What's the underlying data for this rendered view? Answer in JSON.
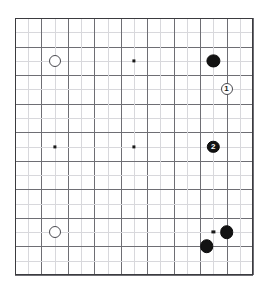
{
  "diagram": {
    "kind": "go-board-diagram",
    "board_size": 19,
    "canvas": {
      "width": 269,
      "height": 297
    },
    "board_rect": {
      "left": 15,
      "top": 18,
      "right": 253,
      "bottom": 275
    },
    "colors": {
      "background": "#ffffff",
      "border": "#3b3b3f",
      "gridline": "#6e6e74",
      "gridline_faint": "#d8d8dc",
      "black_stone": "#131313",
      "white_stone": "#ffffff",
      "white_stone_edge": "#4a4a50",
      "hoshi": "#1a1a1a"
    },
    "star_points": [
      {
        "col": 3,
        "row": 3
      },
      {
        "col": 9,
        "row": 3
      },
      {
        "col": 15,
        "row": 3
      },
      {
        "col": 3,
        "row": 9
      },
      {
        "col": 9,
        "row": 9
      },
      {
        "col": 15,
        "row": 9
      },
      {
        "col": 3,
        "row": 15
      },
      {
        "col": 9,
        "row": 15
      },
      {
        "col": 15,
        "row": 15
      }
    ],
    "stones": [
      {
        "id": "w-upper-left",
        "color": "white",
        "col": 3,
        "row": 3,
        "label": "",
        "radius": 6.0
      },
      {
        "id": "b-upper-right",
        "color": "black",
        "col": 15,
        "row": 3,
        "label": "",
        "radius": 6.6
      },
      {
        "id": "w-move-1",
        "color": "white",
        "col": 16,
        "row": 5,
        "label": "1",
        "radius": 6.0
      },
      {
        "id": "b-move-2",
        "color": "black",
        "col": 15,
        "row": 9,
        "label": "2",
        "radius": 6.2
      },
      {
        "id": "w-lower-left",
        "color": "white",
        "col": 3,
        "row": 15,
        "label": "",
        "radius": 6.0
      },
      {
        "id": "b-lower-right",
        "color": "black",
        "col": 16,
        "row": 15,
        "label": "",
        "radius": 6.8
      },
      {
        "id": "b-lower-inner",
        "color": "black",
        "col": 14.5,
        "row": 16,
        "label": "",
        "radius": 6.8
      }
    ],
    "move_labels": [
      "1",
      "2"
    ]
  }
}
